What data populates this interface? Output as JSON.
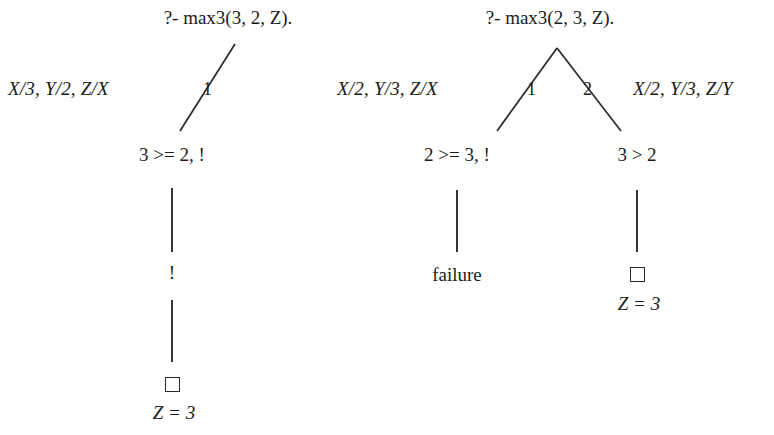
{
  "figure": {
    "type": "sld-resolution-tree",
    "background_color": "#ffffff",
    "ink_color": "#1c1c1c"
  },
  "left_tree": {
    "query": "?- max3(3, 2, Z).",
    "bindings": "X/3, Y/2, Z/X",
    "branch_label": "1",
    "nodes": {
      "goal1": "3 >= 2, !",
      "goal2": "!",
      "answer": "Z = 3"
    },
    "empty_box": "□"
  },
  "right_tree": {
    "query": "?- max3(2, 3, Z).",
    "left_bindings": "X/2, Y/3, Z/X",
    "left_branch_label": "1",
    "right_branch_label": "2",
    "right_bindings": "X/2, Y/3, Z/Y",
    "nodes": {
      "left_goal": "2 >= 3, !",
      "left_leaf": "failure",
      "right_goal": "3 > 2",
      "right_answer": "Z = 3"
    },
    "empty_box": "□"
  }
}
